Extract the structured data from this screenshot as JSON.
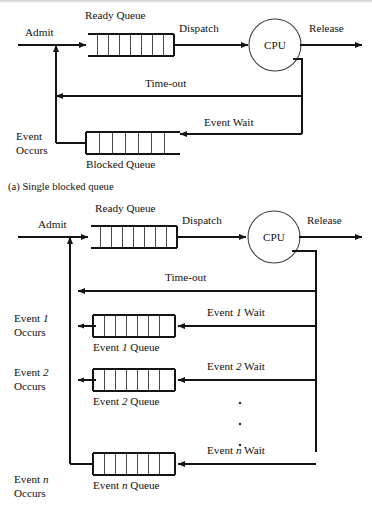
{
  "figure": {
    "title_a": "(a) Single blocked queue",
    "title_b": "(b) Multiple blocked queues"
  },
  "diagram_a": {
    "caption": "(a) Single blocked queue",
    "admit_label": "Admit",
    "ready_queue_label": "Ready Queue",
    "dispatch_label": "Dispatch",
    "cpu_label": "CPU",
    "release_label": "Release",
    "timeout_label": "Time-out",
    "event_wait_label": "Event Wait",
    "event_occurs_line1": "Event",
    "event_occurs_line2": "Occurs",
    "blocked_queue_label": "Blocked Queue",
    "ready_queue_cells": 7,
    "blocked_queue_cells": 7
  },
  "diagram_b": {
    "admit_label": "Admit",
    "ready_queue_label": "Ready Queue",
    "dispatch_label": "Dispatch",
    "cpu_label": "CPU",
    "release_label": "Release",
    "timeout_label": "Time-out",
    "ready_queue_cells": 7,
    "vertical_ellipsis": [
      "•",
      "•",
      "•"
    ],
    "events": [
      {
        "occurs_line1_pre": "Event ",
        "occurs_index": "1",
        "occurs_line2": "Occurs",
        "queue_label_pre": "Event ",
        "queue_label_post": " Queue",
        "wait_label_pre": "Event ",
        "wait_label_post": " Wait",
        "cells": 7
      },
      {
        "occurs_line1_pre": "Event ",
        "occurs_index": "2",
        "occurs_line2": "Occurs",
        "queue_label_pre": "Event ",
        "queue_label_post": " Queue",
        "wait_label_pre": "Event ",
        "wait_label_post": " Wait",
        "cells": 7
      },
      {
        "occurs_line1_pre": "Event ",
        "occurs_index": "n",
        "occurs_line2": "Occurs",
        "queue_label_pre": "Event ",
        "queue_label_post": " Queue",
        "wait_label_pre": "Event ",
        "wait_label_post": " Wait",
        "cells": 7
      }
    ]
  },
  "colors": {
    "ink": "#141414",
    "paper": "#ffffff",
    "rule": "#3b3b3b"
  }
}
